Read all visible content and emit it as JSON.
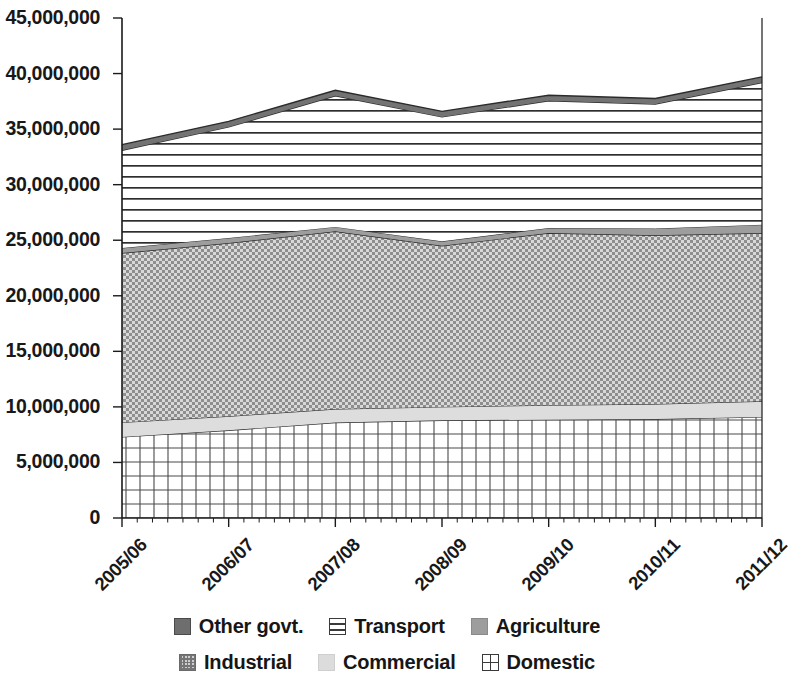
{
  "chart_data": {
    "type": "area",
    "stacked": true,
    "title": "",
    "subtitle": "",
    "xlabel": "",
    "ylabel": "",
    "categories": [
      "2005/06",
      "2006/07",
      "2007/08",
      "2008/09",
      "2009/10",
      "2010/11",
      "2011/12"
    ],
    "ylim": [
      0,
      45000000
    ],
    "ytick_labels": [
      "0",
      "5,000,000",
      "10,000,000",
      "15,000,000",
      "20,000,000",
      "25,000,000",
      "30,000,000",
      "35,000,000",
      "40,000,000",
      "45,000,000"
    ],
    "ytick_values": [
      0,
      5000000,
      10000000,
      15000000,
      20000000,
      25000000,
      30000000,
      35000000,
      40000000,
      45000000
    ],
    "grid": false,
    "legend_position": "bottom",
    "series": [
      {
        "name": "Domestic",
        "pattern": "grid",
        "color": "#ffffff",
        "values": [
          7300000,
          7900000,
          8600000,
          8800000,
          8850000,
          8900000,
          9100000
        ]
      },
      {
        "name": "Commercial",
        "pattern": "solid-light",
        "color": "#dcdcdc",
        "values": [
          1300000,
          1250000,
          1200000,
          1200000,
          1300000,
          1350000,
          1400000
        ]
      },
      {
        "name": "Industrial",
        "pattern": "crosshatch",
        "color": "#cfcfcf",
        "values": [
          15250000,
          15600000,
          16000000,
          14500000,
          15500000,
          15200000,
          15150000
        ]
      },
      {
        "name": "Agriculture",
        "pattern": "solid-mid",
        "color": "#9d9d9d",
        "values": [
          450000,
          450000,
          400000,
          400000,
          450000,
          600000,
          750000
        ]
      },
      {
        "name": "Transport",
        "pattern": "horizontal-lines",
        "color": "#ffffff",
        "values": [
          8800000,
          10000000,
          11800000,
          11200000,
          11450000,
          11200000,
          12800000
        ]
      },
      {
        "name": "Other govt.",
        "pattern": "solid-dark",
        "color": "#6e6e6e",
        "values": [
          500000,
          500000,
          500000,
          500000,
          500000,
          500000,
          500000
        ]
      }
    ],
    "series_totals": [
      33600000,
      35700000,
      38500000,
      36600000,
      38050000,
      37750000,
      39700000
    ],
    "cumulative_tops": {
      "Domestic": [
        7300000,
        7900000,
        8600000,
        8800000,
        8850000,
        8900000,
        9100000
      ],
      "Commercial": [
        8600000,
        9150000,
        9800000,
        10000000,
        10150000,
        10250000,
        10500000
      ],
      "Industrial": [
        23850000,
        24750000,
        25800000,
        24500000,
        25650000,
        25450000,
        25650000
      ],
      "Agriculture": [
        24300000,
        25200000,
        26200000,
        24900000,
        26100000,
        26050000,
        26400000
      ],
      "Transport": [
        33100000,
        35200000,
        38000000,
        36100000,
        37550000,
        37250000,
        39200000
      ],
      "Other govt.": [
        33600000,
        35700000,
        38500000,
        36600000,
        38050000,
        37750000,
        39700000
      ]
    }
  },
  "legend": {
    "rows": [
      [
        {
          "label": "Other govt.",
          "swatch": "sw-other",
          "icon": "legend-swatch-other-govt-icon"
        },
        {
          "label": "Transport",
          "swatch": "sw-transport",
          "icon": "legend-swatch-transport-icon"
        },
        {
          "label": "Agriculture",
          "swatch": "sw-agri",
          "icon": "legend-swatch-agriculture-icon"
        }
      ],
      [
        {
          "label": "Industrial",
          "swatch": "sw-industrial",
          "icon": "legend-swatch-industrial-icon"
        },
        {
          "label": "Commercial",
          "swatch": "sw-commercial",
          "icon": "legend-swatch-commercial-icon"
        },
        {
          "label": "Domestic",
          "swatch": "sw-domestic",
          "icon": "legend-swatch-domestic-icon"
        }
      ]
    ]
  },
  "axes": {
    "plot_left": 122,
    "plot_right": 762,
    "plot_top": 18,
    "plot_bottom": 518,
    "minor_ticks_x": 6
  },
  "colors": {
    "other_govt": "#6e6e6e",
    "agriculture": "#9d9d9d",
    "commercial": "#dcdcdc",
    "industrial": "#cfcfcf",
    "axis": "#1a1a1a",
    "outline": "#2b2b2b",
    "background": "#ffffff"
  }
}
